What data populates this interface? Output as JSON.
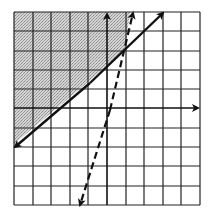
{
  "diagram": {
    "type": "system-of-linear-inequalities-graph",
    "grid": {
      "x_range": [
        -5,
        5
      ],
      "y_range": [
        -5,
        5
      ],
      "columns": 10,
      "rows": 10,
      "pixel_bounds": {
        "left": 14,
        "right": 200,
        "top": 12,
        "bottom": 205
      },
      "origin_px": {
        "x": 107,
        "y": 108
      }
    },
    "axes": {
      "x_axis": {
        "arrow": "right"
      },
      "y_axis": {
        "arrow": "up"
      }
    },
    "lines": [
      {
        "name": "solid-boundary",
        "style": "solid",
        "equation_estimate": "y = (5/6)x + 13/6",
        "points": [
          [
            -5,
            -2
          ],
          [
            1,
            3
          ],
          [
            3,
            4.7
          ]
        ],
        "arrows": "both"
      },
      {
        "name": "dashed-boundary",
        "style": "dashed",
        "equation_estimate": "y = 3.5x - 0.5",
        "points": [
          [
            -1.5,
            -5.2
          ],
          [
            1,
            3
          ],
          [
            1.4,
            5.2
          ]
        ],
        "arrows": "both"
      }
    ],
    "intersection": [
      1,
      3
    ],
    "shaded_region": {
      "description": "above solid line and left of dashed line (upper-left)",
      "fill": "#bdbdbd"
    },
    "colors": {
      "grid": "#222222",
      "lines": "#111111",
      "shade": "#c4c4c4",
      "background": "#ffffff"
    }
  }
}
